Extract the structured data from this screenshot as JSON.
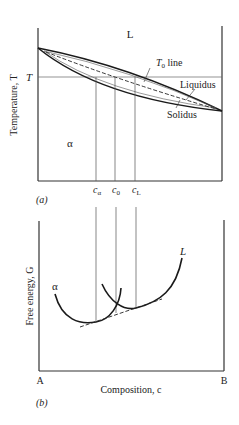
{
  "panel_a": {
    "tag": "(a)",
    "y_axis_label": "Temperature, T",
    "temp_marker": "T",
    "region_liquid": "L",
    "region_solid": "α",
    "t0_line_label_base": "T",
    "t0_line_label_sub": "0",
    "t0_line_label_rest": " line",
    "liquidus_label": "Liquidus",
    "solidus_label": "Solidus",
    "composition_markers": [
      {
        "base": "c",
        "sub": "α"
      },
      {
        "base": "c",
        "sub": "0"
      },
      {
        "base": "c",
        "sub": "L"
      }
    ]
  },
  "panel_b": {
    "tag": "(b)",
    "y_axis_label": "Free energy, G",
    "x_axis_label": "Composition, c",
    "left_end_label": "A",
    "right_end_label": "B",
    "curve_alpha_label": "α",
    "curve_liquid_label": "L"
  },
  "colors": {
    "line": "#1a1a1a",
    "thin_line": "#555555",
    "axis": "#333333"
  }
}
